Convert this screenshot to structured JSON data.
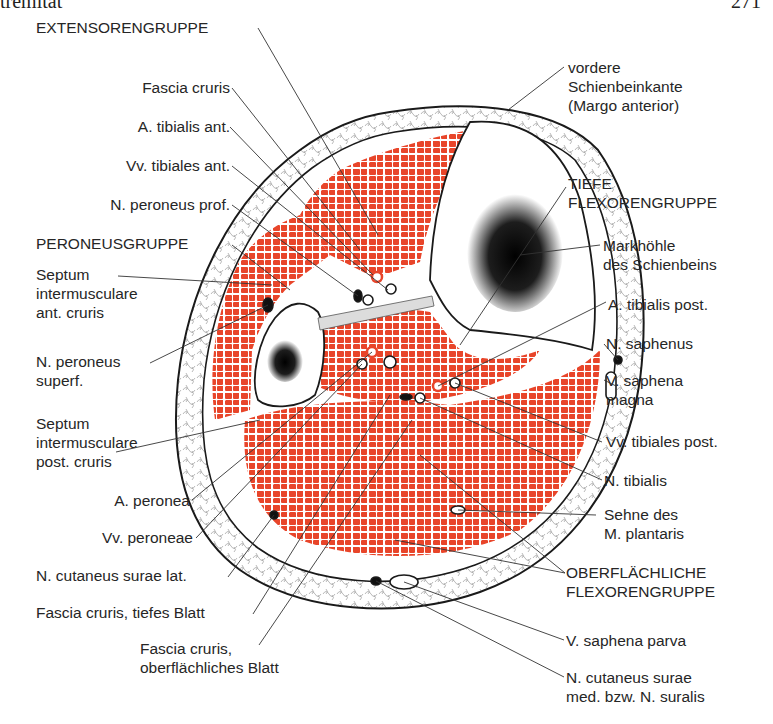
{
  "page_header": {
    "left": "tremität",
    "right": "271"
  },
  "colors": {
    "muscle": "#e8452a",
    "outline": "#1a1a1a",
    "subcutis": "#ffffff",
    "marrow": "#111111"
  },
  "figure": {
    "labels_left": [
      {
        "id": "extensoren",
        "text": "EXTENSORENGRUPPE"
      },
      {
        "id": "fascia_cruris",
        "text": "Fascia cruris"
      },
      {
        "id": "a_tib_ant",
        "text": "A. tibialis ant."
      },
      {
        "id": "vv_tib_ant",
        "text": "Vv. tibiales ant."
      },
      {
        "id": "n_per_prof",
        "text": "N. peroneus prof."
      },
      {
        "id": "peroneus",
        "text": "PERONEUSGRUPPE"
      },
      {
        "id": "septum_ant",
        "text": [
          "Septum",
          "intermusculare",
          "ant. cruris"
        ]
      },
      {
        "id": "n_per_sup",
        "text": [
          "N. peroneus",
          "superf."
        ]
      },
      {
        "id": "septum_post",
        "text": [
          "Septum",
          "intermusculare",
          "post. cruris"
        ]
      },
      {
        "id": "a_peronea",
        "text": "A. peronea"
      },
      {
        "id": "vv_peroneae",
        "text": "Vv. peroneae"
      },
      {
        "id": "n_cut_lat",
        "text": "N. cutaneus surae lat."
      },
      {
        "id": "fascia_tief",
        "text": "Fascia cruris, tiefes Blatt"
      },
      {
        "id": "fascia_oberfl",
        "text": [
          "Fascia cruris,",
          "oberflächliches Blatt"
        ]
      }
    ],
    "labels_right": [
      {
        "id": "margo",
        "text": [
          "vordere",
          "Schienbeinkante",
          "(Margo anterior)"
        ]
      },
      {
        "id": "tiefe_flex",
        "text": [
          "TIEFE",
          "FLEXORENGRUPPE"
        ]
      },
      {
        "id": "markhoehle",
        "text": [
          "Markhöhle",
          "des Schienbeins"
        ]
      },
      {
        "id": "a_tib_post",
        "text": "A. tibialis post."
      },
      {
        "id": "n_saph",
        "text": "N. saphenus"
      },
      {
        "id": "v_saph_magna",
        "text": [
          "V. saphena",
          "magna"
        ]
      },
      {
        "id": "vv_tib_post",
        "text": "Vv. tibiales post."
      },
      {
        "id": "n_tib",
        "text": "N. tibialis"
      },
      {
        "id": "sehne_plant",
        "text": [
          "Sehne des",
          "M. plantaris"
        ]
      },
      {
        "id": "oberfl_flex",
        "text": [
          "OBERFLÄCHLICHE",
          "FLEXORENGRUPPE"
        ]
      },
      {
        "id": "v_saph_parva",
        "text": "V. saphena parva"
      },
      {
        "id": "n_suralis",
        "text": [
          "N. cutaneus surae",
          "med. bzw. N. suralis"
        ]
      }
    ]
  }
}
